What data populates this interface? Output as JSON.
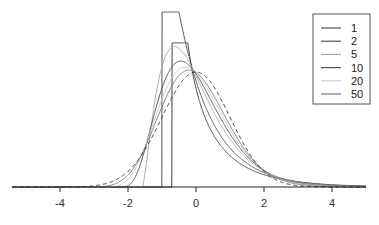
{
  "chart_data": {
    "type": "line",
    "title": "",
    "xlabel": "",
    "ylabel": "",
    "xlim": [
      -5.5,
      5
    ],
    "x_ticks": [
      -4,
      -2,
      0,
      2,
      4
    ],
    "x_tick_labels": [
      "-4",
      "-2",
      "0",
      "2",
      "4"
    ],
    "grid": false,
    "legend_position": "top-right",
    "series": [
      {
        "name": "1",
        "df": 1,
        "color": "#444444",
        "dash": ""
      },
      {
        "name": "2",
        "df": 2,
        "color": "#555555",
        "dash": ""
      },
      {
        "name": "5",
        "df": 5,
        "color": "#aaaaaa",
        "dash": ""
      },
      {
        "name": "10",
        "df": 10,
        "color": "#555555",
        "dash": ""
      },
      {
        "name": "20",
        "df": 20,
        "color": "#cccccc",
        "dash": ""
      },
      {
        "name": "50",
        "df": 50,
        "color": "#777777",
        "dash": ""
      },
      {
        "name": "normal",
        "df": null,
        "color": "#333333",
        "dash": "4,3"
      }
    ]
  },
  "legend": {
    "items": [
      {
        "label": "1",
        "color": "#555555"
      },
      {
        "label": "2",
        "color": "#555555"
      },
      {
        "label": "5",
        "color": "#aaaaaa"
      },
      {
        "label": "10",
        "color": "#555555"
      },
      {
        "label": "20",
        "color": "#cccccc"
      },
      {
        "label": "50",
        "color": "#777777"
      }
    ]
  }
}
